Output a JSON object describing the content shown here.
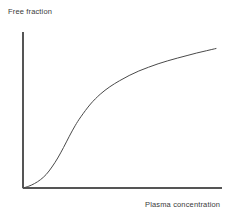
{
  "chart_data": {
    "type": "line",
    "title": "",
    "subtitle": "",
    "xlabel": "Plasma concentration",
    "ylabel": "Free fraction",
    "xlabel_position": "bottom-right",
    "ylabel_position": "top-left",
    "grid": false,
    "legend": null,
    "xticks": [],
    "yticks": [],
    "xtick_labels": [],
    "ytick_labels": [],
    "xlim": [
      0,
      1
    ],
    "ylim": [
      0,
      1
    ],
    "axis_color": "#555555",
    "curve_color": "#4a4a4a",
    "curve_width_px": 1,
    "annotations": [],
    "series": [
      {
        "name": "Free fraction",
        "description": "Saturable plasma protein binding: free fraction rises slowly at low plasma concentration, steeply through the inflection, then flattens as binding sites saturate.",
        "x": [
          0.0,
          0.03,
          0.06,
          0.09,
          0.12,
          0.15,
          0.18,
          0.21,
          0.24,
          0.27,
          0.3,
          0.35,
          0.4,
          0.45,
          0.5,
          0.55,
          0.6,
          0.65,
          0.7,
          0.75,
          0.8,
          0.85,
          0.9,
          0.95,
          1.0
        ],
        "y": [
          0.0,
          0.012,
          0.03,
          0.055,
          0.09,
          0.14,
          0.2,
          0.27,
          0.345,
          0.415,
          0.475,
          0.56,
          0.625,
          0.675,
          0.715,
          0.75,
          0.78,
          0.805,
          0.828,
          0.848,
          0.866,
          0.883,
          0.9,
          0.915,
          0.93
        ]
      }
    ]
  },
  "figure": {
    "plot_area": {
      "origin_x": 23,
      "origin_y": 188,
      "axis_top_y": 32,
      "axis_right_x": 222
    }
  }
}
